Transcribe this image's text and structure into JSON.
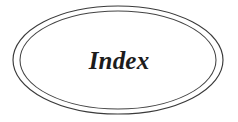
{
  "page": {
    "background_color": "#ffffff",
    "width": 238,
    "height": 122
  },
  "divider": {
    "label": "Index",
    "label_color": "#1c1c1c",
    "label_style": "bold-italic-serif",
    "shape": "double-ellipse",
    "outer_ellipse": {
      "center_x": 118,
      "center_y": 60,
      "radius_x": 105,
      "radius_y": 54,
      "stroke_color": "#3a3a3a"
    },
    "inner_ellipse": {
      "center_x": 118,
      "center_y": 60,
      "radius_x": 98,
      "radius_y": 49,
      "stroke_color": "#444444"
    }
  }
}
